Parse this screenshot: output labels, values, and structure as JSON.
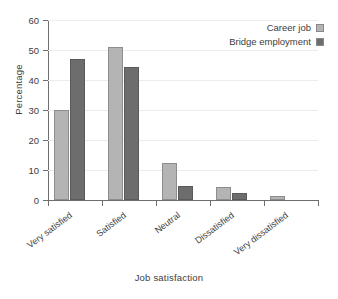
{
  "chart_data": {
    "type": "bar",
    "title": "",
    "subtitle": "",
    "xlabel": "Job satisfaction",
    "ylabel": "Percentage",
    "categories": [
      "Very satisfied",
      "Satisfied",
      "Neutral",
      "Dissatisfied",
      "Very dissatisfied"
    ],
    "series": [
      {
        "name": "Career job",
        "color": "#b4b4b4",
        "values": [
          30,
          51,
          12.3,
          4.3,
          1.5
        ]
      },
      {
        "name": "Bridge employment",
        "color": "#6d6d6d",
        "values": [
          47,
          44.5,
          4.7,
          2.5,
          0
        ]
      }
    ],
    "ylim": [
      0,
      60
    ],
    "yticks": [
      0,
      10,
      20,
      30,
      40,
      50,
      60
    ],
    "ytick_labels": [
      "0",
      "10",
      "20",
      "30",
      "40",
      "50",
      "60"
    ],
    "grid": true,
    "grid_axis": "y",
    "legend_position": "top-right",
    "xtick_label_rotation": -37,
    "bar_orientation": "vertical",
    "grouping": "clustered"
  },
  "legend": {
    "items": [
      {
        "label": "Career job"
      },
      {
        "label": "Bridge employment"
      }
    ]
  }
}
